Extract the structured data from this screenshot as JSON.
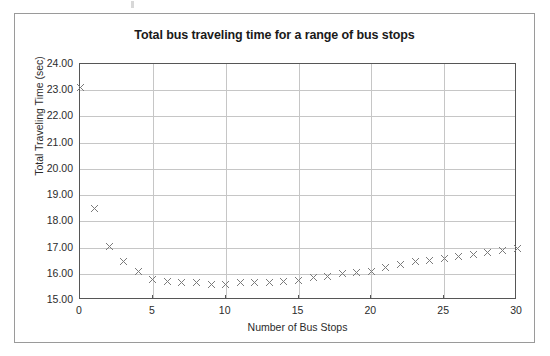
{
  "chart_data": {
    "type": "scatter",
    "title": "Total bus traveling time for a range of bus stops",
    "xlabel": "Number of Bus Stops",
    "ylabel": "Total Traveling Time (sec)",
    "xlim": [
      0,
      30
    ],
    "ylim": [
      15.0,
      24.0
    ],
    "xticks": [
      0,
      5,
      10,
      15,
      20,
      25,
      30
    ],
    "xtick_labels": [
      "0",
      "5",
      "10",
      "15",
      "20",
      "25",
      "30"
    ],
    "yticks": [
      15.0,
      16.0,
      17.0,
      18.0,
      19.0,
      20.0,
      21.0,
      22.0,
      23.0,
      24.0
    ],
    "ytick_labels": [
      "15.00",
      "16.00",
      "17.00",
      "18.00",
      "19.00",
      "20.00",
      "21.00",
      "22.00",
      "23.00",
      "24.00"
    ],
    "grid": true,
    "legend": false,
    "marker": "x",
    "marker_color": "#7b7b7b",
    "series": [
      {
        "name": "Total traveling time",
        "x": [
          0,
          1,
          2,
          3,
          4,
          5,
          6,
          7,
          8,
          9,
          10,
          11,
          12,
          13,
          14,
          15,
          16,
          17,
          18,
          19,
          20,
          21,
          22,
          23,
          24,
          25,
          26,
          27,
          28,
          29,
          30
        ],
        "values": [
          23.1,
          18.5,
          17.05,
          16.45,
          16.1,
          15.8,
          15.7,
          15.65,
          15.65,
          15.6,
          15.6,
          15.65,
          15.65,
          15.65,
          15.7,
          15.75,
          15.85,
          15.9,
          16.0,
          16.05,
          16.1,
          16.25,
          16.35,
          16.45,
          16.5,
          16.6,
          16.65,
          16.75,
          16.8,
          16.9,
          16.95
        ]
      }
    ]
  },
  "figure": {
    "title": "Total bus traveling time for a range of bus stops"
  }
}
